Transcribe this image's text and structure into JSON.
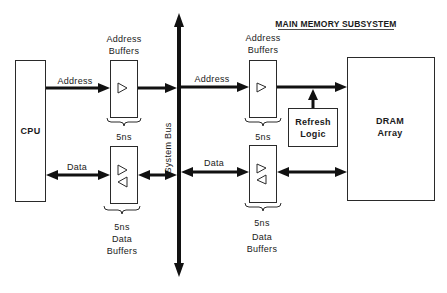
{
  "title": "MAIN MEMORY SUBSYSTEM",
  "blocks": {
    "cpu": {
      "label": "CPU"
    },
    "dram": {
      "label_line1": "DRAM",
      "label_line2": "Array"
    },
    "refresh": {
      "label_line1": "Refresh",
      "label_line2": "Logic"
    }
  },
  "bus": {
    "label": "System Bus"
  },
  "cpu_side": {
    "address_buffers": {
      "label_line1": "Address",
      "label_line2": "Buffers",
      "delay": "5ns"
    },
    "data_buffers": {
      "delay": "5ns",
      "label_line1": "Data",
      "label_line2": "Buffers"
    },
    "address_signal": "Address",
    "data_signal": "Data"
  },
  "memory_side": {
    "address_buffers": {
      "label_line1": "Address",
      "label_line2": "Buffers",
      "delay": "5ns"
    },
    "data_buffers": {
      "delay": "5ns",
      "label_line1": "Data",
      "label_line2": "Buffers"
    },
    "address_signal": "Address",
    "data_signal": "Data"
  },
  "colors": {
    "ink": "#111111",
    "paper": "#ffffff"
  }
}
